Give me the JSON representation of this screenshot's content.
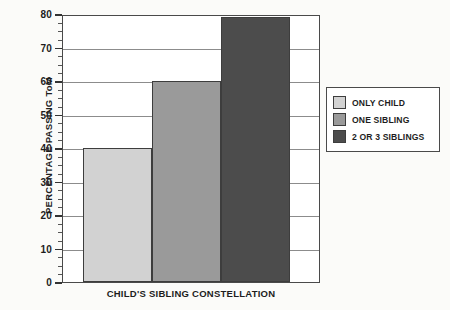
{
  "chart_data": {
    "type": "bar",
    "title": "",
    "xlabel": "CHILD'S SIBLING CONSTELLATION",
    "ylabel": "PERCENTAGE PASSING ToM",
    "categories": [
      "ONLY CHILD",
      "ONE SIBLING",
      "2 OR 3 SIBLINGS"
    ],
    "values": [
      40,
      60,
      79
    ],
    "ylim": [
      0,
      80
    ],
    "ytick_labels": [
      "0",
      "10",
      "20",
      "30",
      "40",
      "50",
      "60",
      "70",
      "80"
    ],
    "ytick_values": [
      0,
      10,
      20,
      30,
      40,
      50,
      60,
      70,
      80
    ],
    "minor_tick_step": 2.5,
    "grid": "horizontal",
    "legend_position": "right",
    "bar_colors": [
      "#d2d2d2",
      "#9a9a9a",
      "#4c4c4c"
    ],
    "series": [
      {
        "name": "ONLY CHILD",
        "value": 40,
        "color": "#d2d2d2"
      },
      {
        "name": "ONE SIBLING",
        "value": 60,
        "color": "#9a9a9a"
      },
      {
        "name": "2 OR 3 SIBLINGS",
        "value": 79,
        "color": "#4c4c4c"
      }
    ]
  },
  "legend": {
    "items": [
      {
        "label": "ONLY CHILD",
        "color": "#d2d2d2"
      },
      {
        "label": "ONE SIBLING",
        "color": "#9a9a9a"
      },
      {
        "label": "2 OR 3 SIBLINGS",
        "color": "#4c4c4c"
      }
    ]
  }
}
